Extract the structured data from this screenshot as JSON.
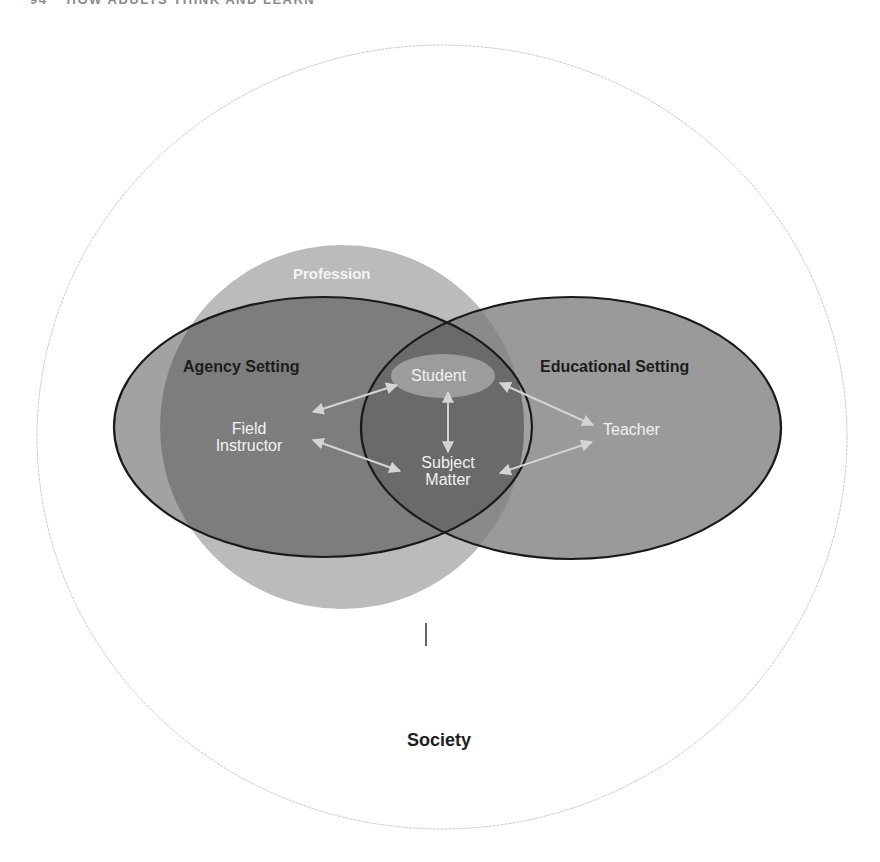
{
  "header": {
    "page_number": "94",
    "running_title": "HOW ADULTS THINK AND LEARN"
  },
  "diagram": {
    "outer_region": {
      "label": "Society"
    },
    "profession": {
      "label": "Profession"
    },
    "agency_setting": {
      "label": "Agency Setting"
    },
    "educational_setting": {
      "label": "Educational Setting"
    },
    "nodes": {
      "student": {
        "label": "Student"
      },
      "field_instructor": {
        "line1": "Field",
        "line2": "Instructor"
      },
      "subject_matter": {
        "line1": "Subject",
        "line2": "Matter"
      },
      "teacher": {
        "label": "Teacher"
      }
    },
    "relationships": [
      {
        "from": "Field Instructor",
        "to": "Student",
        "type": "bidirectional"
      },
      {
        "from": "Field Instructor",
        "to": "Subject Matter",
        "type": "bidirectional"
      },
      {
        "from": "Student",
        "to": "Subject Matter",
        "type": "bidirectional"
      },
      {
        "from": "Student",
        "to": "Teacher",
        "type": "bidirectional"
      },
      {
        "from": "Subject Matter",
        "to": "Teacher",
        "type": "bidirectional"
      }
    ],
    "colors": {
      "outer_stroke": "#c8c8c8",
      "profession_fill": "#b5b5b5",
      "agency_fill": "#7d7d7d",
      "educational_fill": "#9a9a9a",
      "overlap_fill": "#6a6a6a",
      "student_fill": "#9c9c9c",
      "ellipse_stroke": "#1a1a1a",
      "arrow": "#d4d4d4"
    }
  }
}
